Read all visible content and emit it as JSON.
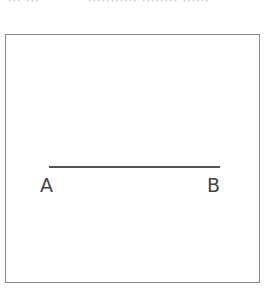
{
  "header": {
    "cropped_text_left": "··· ···",
    "cropped_text_right": "··········· ········ ······"
  },
  "diagram": {
    "type": "line-segment",
    "points": [
      {
        "label": "A"
      },
      {
        "label": "B"
      }
    ],
    "line_color": "#555555",
    "frame_color": "#8a8a8a"
  }
}
